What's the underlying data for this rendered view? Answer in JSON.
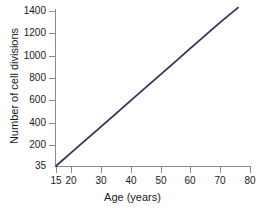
{
  "chart_data": {
    "type": "line",
    "title": "",
    "xlabel": "Age (years)",
    "ylabel": "Number of cell divisions",
    "xlim": [
      15,
      80
    ],
    "ylim": [
      35,
      1430
    ],
    "grid": false,
    "legend": "none",
    "line_color": "#26315e",
    "axis_color": "#8a8a8a",
    "xticks": [
      15,
      20,
      30,
      40,
      50,
      60,
      70,
      80
    ],
    "xtick_labels": [
      "15",
      "20",
      "30",
      "40",
      "50",
      "60",
      "70",
      "80"
    ],
    "yticks": [
      35,
      200,
      400,
      600,
      800,
      1000,
      1200,
      1400
    ],
    "ytick_labels": [
      "35",
      "200",
      "400",
      "600",
      "800",
      "1000",
      "1200",
      "1400"
    ],
    "series": [
      {
        "name": "cell divisions vs age",
        "x": [
          15,
          20,
          25,
          30,
          35,
          40,
          45,
          50,
          55,
          60,
          65,
          70,
          76
        ],
        "y": [
          35,
          150,
          265,
          380,
          495,
          610,
          725,
          840,
          955,
          1070,
          1185,
          1300,
          1430
        ]
      }
    ]
  },
  "axes": {
    "x_title": "Age (years)",
    "y_title": "Number of cell divisions"
  }
}
